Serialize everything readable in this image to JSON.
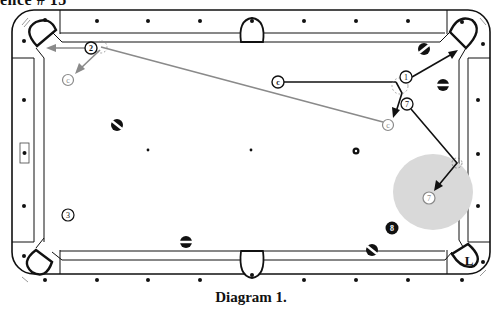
{
  "heading": "ence # 15",
  "caption": "Diagram 1.",
  "colors": {
    "line": "#111111",
    "gray_path": "#8a8a8a",
    "zone": "#d9d9d9",
    "background": "#ffffff"
  },
  "table": {
    "diamonds_top": [
      98,
      148,
      200,
      304,
      356,
      408
    ],
    "diamonds_bottom": [
      98,
      148,
      200,
      304,
      356,
      408
    ],
    "diamonds_left": [
      72,
      155,
      206
    ],
    "diamonds_right": [
      100,
      155,
      206
    ],
    "spots": [
      {
        "x": 148,
        "y": 150
      },
      {
        "x": 251,
        "y": 150
      }
    ]
  },
  "balls": [
    {
      "id": "ball-2",
      "label": "2",
      "x": 91,
      "y": 48,
      "style": "numbered"
    },
    {
      "id": "cue-ghost-1",
      "label": "c",
      "x": 68,
      "y": 80,
      "style": "ghost"
    },
    {
      "id": "ball-stripe-1",
      "label": "",
      "x": 117,
      "y": 125,
      "style": "stripe"
    },
    {
      "id": "cue-ball",
      "label": "c",
      "x": 278,
      "y": 82,
      "style": "numbered"
    },
    {
      "id": "ball-1",
      "label": "1",
      "x": 406,
      "y": 80,
      "style": "numbered"
    },
    {
      "id": "ball-7",
      "label": "7",
      "x": 408,
      "y": 104,
      "style": "numbered"
    },
    {
      "id": "cue-ghost-2",
      "label": "c",
      "x": 388,
      "y": 125,
      "style": "ghost"
    },
    {
      "id": "ball-7-ghost",
      "label": "7",
      "x": 429,
      "y": 198,
      "style": "ghost"
    },
    {
      "id": "ball-stripe-2",
      "label": "",
      "x": 424,
      "y": 49,
      "style": "stripe"
    },
    {
      "id": "ball-stripe-3",
      "label": "",
      "x": 443,
      "y": 85,
      "style": "stripe"
    },
    {
      "id": "ball-solid-small",
      "label": "",
      "x": 356,
      "y": 151,
      "style": "solid-small"
    },
    {
      "id": "ball-3",
      "label": "3",
      "x": 68,
      "y": 215,
      "style": "numbered"
    },
    {
      "id": "ball-stripe-4",
      "label": "",
      "x": 186,
      "y": 242,
      "style": "stripe"
    },
    {
      "id": "ball-8",
      "label": "8",
      "x": 392,
      "y": 228,
      "style": "eight"
    },
    {
      "id": "ball-stripe-5",
      "label": "",
      "x": 372,
      "y": 250,
      "style": "stripe"
    }
  ],
  "pocket_label": "L",
  "zones": [
    {
      "x": 433,
      "y": 190,
      "rx": 40,
      "ry": 38
    }
  ]
}
